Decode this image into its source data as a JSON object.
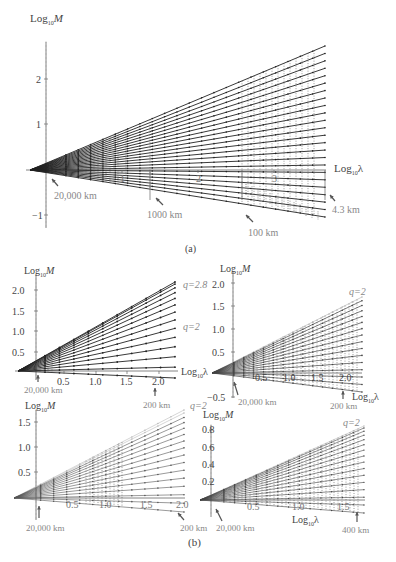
{
  "chart_data": [
    {
      "panel": "(a)",
      "type": "line",
      "ylabel": "Log10 M",
      "xlabel": "Log10 λ",
      "yticks": [
        2,
        1,
        -1
      ],
      "xticks": [
        1,
        2,
        3
      ],
      "xlim": [
        -0.2,
        3.6
      ],
      "ylim": [
        -1.3,
        3.0
      ],
      "num_lines": 24,
      "line_end_x": 3.6,
      "top_line_end_y": 2.75,
      "bottom_line_end_y": -1.05,
      "annotations": [
        {
          "text": "20,000 km",
          "x": 0.0
        },
        {
          "text": "1000 km",
          "x": 1.3
        },
        {
          "text": "100 km",
          "x": 2.3
        },
        {
          "text": "4.3 km",
          "x": 3.6
        }
      ],
      "grid": false
    },
    {
      "panel": "(b) top-left",
      "type": "line",
      "ylabel": "Log10 M",
      "xlabel": "Log10 λ",
      "yticks": [
        0.5,
        1.0,
        1.5,
        2.0
      ],
      "xticks": [
        0.5,
        1.0,
        1.5,
        2.0
      ],
      "num_lines": 14,
      "top_line_end_y": 2.2,
      "annotations": [
        {
          "text": "q=2.8",
          "note": "top line"
        },
        {
          "text": "q=2",
          "note": "middle line"
        },
        {
          "text": "20,000 km",
          "x": 0.0
        },
        {
          "text": "200 km",
          "x": 2.0
        }
      ]
    },
    {
      "panel": "(b) top-right",
      "type": "line",
      "ylabel": "Log10 M",
      "xlabel": "Log10 λ",
      "yticks": [
        -0.5,
        0.5,
        1.0,
        1.5,
        2.0
      ],
      "xticks": [
        0.5,
        1.0,
        1.5,
        2.0
      ],
      "num_lines": 16,
      "annotations": [
        {
          "text": "q=2",
          "note": "top line"
        },
        {
          "text": "20,000 km",
          "x": 0.0
        },
        {
          "text": "200 km",
          "x": 2.0
        }
      ]
    },
    {
      "panel": "(b) bottom-left",
      "type": "line",
      "ylabel": "Log10 M",
      "xlabel": "",
      "yticks": [
        0.5,
        1.0,
        1.5
      ],
      "xticks": [
        0.5,
        1.0,
        1.5,
        2.0
      ],
      "num_lines": 16,
      "annotations": [
        {
          "text": "q=2",
          "note": "top line"
        },
        {
          "text": "20,000 km",
          "x": 0.0
        },
        {
          "text": "200 km",
          "x": 2.0
        }
      ]
    },
    {
      "panel": "(b) bottom-right",
      "type": "line",
      "ylabel": "Log10 M",
      "xlabel": "Log10 λ",
      "yticks": [
        0.2,
        0.4,
        0.6,
        0.8
      ],
      "xticks": [
        0.5,
        1.0,
        1.5
      ],
      "num_lines": 16,
      "annotations": [
        {
          "text": "q=2",
          "note": "top line"
        },
        {
          "text": "20,000 km",
          "x": 0.0
        },
        {
          "text": "400 km",
          "x": 1.6
        }
      ]
    }
  ],
  "labels": {
    "a": {
      "ylabel_main": "Log",
      "ylabel_sub": "10",
      "ylabel_var": "M",
      "xlabel_main": "Log",
      "xlabel_sub": "10",
      "xlabel_var": "λ",
      "ytick_2": "2",
      "ytick_1": "1",
      "ytick_m1": "−1",
      "xtick_1": "1",
      "xtick_2": "2",
      "xtick_3": "3",
      "ann_20000": "20,000 km",
      "ann_1000": "1000 km",
      "ann_100": "100 km",
      "ann_43": "4.3 km",
      "caption": "(a)"
    },
    "b": {
      "caption": "(b)",
      "tl": {
        "y05": "0.5",
        "y10": "1.0",
        "y15": "1.5",
        "y20": "2.0",
        "x05": "0.5",
        "x10": "1.0",
        "x15": "1.5",
        "x20": "2.0",
        "q_top": "q=2.8",
        "q_mid": "q=2",
        "ann_left": "20,000 km",
        "ann_right": "200 km"
      },
      "tr": {
        "ym05": "−0.5",
        "y05": "0.5",
        "y10": "1.0",
        "y15": "1.5",
        "y20": "2.0",
        "x05": "0.5",
        "x10": "1.0",
        "x15": "1.5",
        "x20": "2.0",
        "q_top": "q=2",
        "ann_left": "20,000 km",
        "ann_right": "200 km"
      },
      "bl": {
        "y05": "0.5",
        "y10": "1.0",
        "y15": "1.5",
        "x05": "0.5",
        "x10": "1.0",
        "x15": "1.5",
        "x20": "2.0",
        "q_top": "q=2",
        "ann_left": "20,000 km",
        "ann_right": "200 km"
      },
      "br": {
        "y02": "0.2",
        "y04": "0.4",
        "y06": "0.6",
        "y08": "0.8",
        "x05": "0.5",
        "x10": "1.0",
        "x15": "1.5",
        "q_top": "q=2",
        "ann_left": "20,000 km",
        "ann_right": "400 km"
      }
    },
    "log": "Log",
    "sub10": "10",
    "M": "M",
    "lambda": "λ"
  }
}
